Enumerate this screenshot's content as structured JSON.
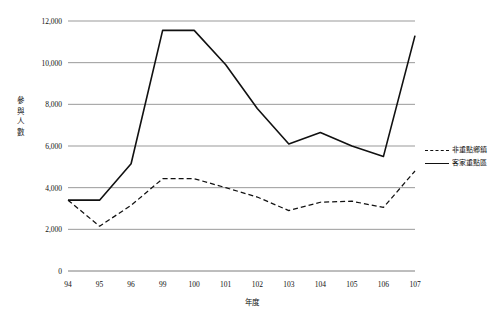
{
  "chart_data": {
    "type": "line",
    "title": "",
    "xlabel": "年度",
    "ylabel": "參與人數",
    "categories": [
      "94",
      "95",
      "96",
      "99",
      "100",
      "101",
      "102",
      "103",
      "104",
      "105",
      "106",
      "107"
    ],
    "ylim": [
      0,
      12000
    ],
    "yticks": [
      0,
      2000,
      4000,
      6000,
      8000,
      10000,
      12000
    ],
    "ytick_labels": [
      "0",
      "2,000",
      "4,000",
      "6,000",
      "8,000",
      "10,000",
      "12,000"
    ],
    "grid": true,
    "legend_position": "right",
    "series": [
      {
        "name": "非重點鄉鎮",
        "style": "dashed",
        "color": "#111111",
        "values": [
          3400,
          2150,
          3150,
          4430,
          4430,
          4000,
          3550,
          2900,
          3300,
          3350,
          3050,
          4800
        ]
      },
      {
        "name": "客家重點區",
        "style": "solid",
        "color": "#111111",
        "values": [
          3400,
          3400,
          5150,
          11550,
          11550,
          9900,
          7800,
          6100,
          6650,
          6000,
          5500,
          11300
        ]
      }
    ]
  },
  "legend": {
    "entries": [
      {
        "label": "非重點鄉鎮"
      },
      {
        "label": "客家重點區"
      }
    ]
  },
  "axes": {
    "y_title": "參與人數",
    "x_title": "年度"
  }
}
